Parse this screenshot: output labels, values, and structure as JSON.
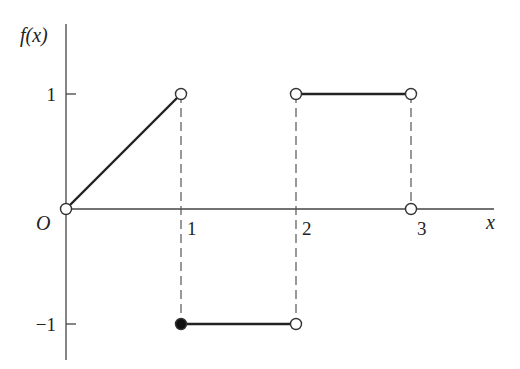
{
  "chart_data": {
    "type": "line",
    "title": "",
    "xlabel": "x",
    "ylabel": "f(x)",
    "origin_label": "O",
    "x_ticks": [
      {
        "value": 1,
        "label": "1"
      },
      {
        "value": 2,
        "label": "2"
      },
      {
        "value": 3,
        "label": "3"
      }
    ],
    "y_ticks": [
      {
        "value": 1,
        "label": "1"
      },
      {
        "value": -1,
        "label": "−1"
      }
    ],
    "xlim": [
      0,
      3.7
    ],
    "ylim": [
      -1.3,
      1.6
    ],
    "grid": false,
    "legend": null,
    "segments": [
      {
        "from": [
          0,
          0
        ],
        "to": [
          1,
          1
        ],
        "start": "open",
        "end": "open"
      },
      {
        "from": [
          1,
          -1
        ],
        "to": [
          2,
          -1
        ],
        "start": "closed",
        "end": "open"
      },
      {
        "from": [
          2,
          1
        ],
        "to": [
          3,
          1
        ],
        "start": "open",
        "end": "open"
      }
    ],
    "isolated_points": [
      {
        "x": 3,
        "y": 0,
        "type": "open"
      }
    ],
    "dashed_guides": [
      {
        "x": 1,
        "y_from": 1,
        "y_to": -1
      },
      {
        "x": 2,
        "y_from": 1,
        "y_to": -1
      },
      {
        "x": 3,
        "y_from": 1,
        "y_to": 0
      }
    ]
  }
}
